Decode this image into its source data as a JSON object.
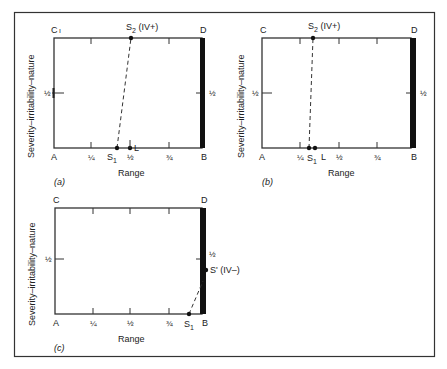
{
  "figure": {
    "colors": {
      "line": "#333333",
      "bar": "#111111",
      "background": "#ffffff"
    },
    "panels": [
      {
        "id": "a",
        "caption": "(a)",
        "corner_labels": {
          "top_left": "C",
          "top_right": "D",
          "bottom_left": "A",
          "bottom_right": "B"
        },
        "y_axis_label": "Severity–irritability–nature",
        "x_axis_label": "Range",
        "y_tick_left": "½",
        "y_tick_right": "½",
        "x_ticks": [
          "¼",
          "½",
          "¾"
        ],
        "points": [
          {
            "name": "S1",
            "label": "S",
            "sub": "1",
            "x": 0.41,
            "y": 0
          },
          {
            "name": "L",
            "label": "L",
            "x": 0.5,
            "y": 0
          },
          {
            "name": "S2",
            "label": "S",
            "sub": "2",
            "suffix": " (IV+)",
            "x": 0.5,
            "y": 1
          }
        ],
        "dashed_line": [
          "S1",
          "S2"
        ]
      },
      {
        "id": "b",
        "caption": "(b)",
        "corner_labels": {
          "top_left": "C",
          "top_right": "D",
          "bottom_left": "A",
          "bottom_right": "B"
        },
        "y_axis_label": "Severity–irritability–nature",
        "x_axis_label": "Range",
        "y_tick_left": "½",
        "y_tick_right": "½",
        "x_ticks": [
          "¼",
          "½",
          "¾"
        ],
        "points": [
          {
            "name": "S1",
            "label": "S",
            "sub": "1",
            "x": 0.31,
            "y": 0
          },
          {
            "name": "L",
            "label": "L",
            "x": 0.35,
            "y": 0
          },
          {
            "name": "S2",
            "label": "S",
            "sub": "2",
            "suffix": " (IV+)",
            "x": 0.335,
            "y": 1
          }
        ],
        "dashed_line": [
          "S1",
          "S2"
        ]
      },
      {
        "id": "c",
        "caption": "(c)",
        "corner_labels": {
          "top_left": "C",
          "top_right": "D",
          "bottom_left": "A",
          "bottom_right": "B"
        },
        "y_axis_label": "Severity–irritability–nature",
        "x_axis_label": "Range",
        "y_tick_left": "½",
        "y_tick_right": "½",
        "x_ticks": [
          "¼",
          "½",
          "¾"
        ],
        "points": [
          {
            "name": "S1",
            "label": "S",
            "sub": "1",
            "x": 0.9,
            "y": 0
          },
          {
            "name": "S'",
            "label": "S' (IV–)",
            "x": 1.0,
            "y": 0.4
          }
        ],
        "dashed_line": [
          "S1",
          "S'"
        ]
      }
    ]
  }
}
